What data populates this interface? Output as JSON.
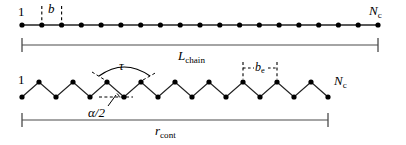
{
  "figure": {
    "background": "#ffffff",
    "ink": "#000000",
    "rule_color": "#4a4a4a"
  },
  "top_chain": {
    "name": "straight-chain",
    "start_label": "1",
    "end_label_symbol": "N",
    "end_label_sub": "c",
    "bead_count": 19,
    "bead_spacing_px": 19.8,
    "first_bead_x": 22,
    "last_bead_x": 378,
    "baseline_y": 25,
    "bond_label_symbol": "b",
    "bond_label_sub": "",
    "bond_marker_left_x": 42,
    "bond_marker_right_x": 62
  },
  "top_measure": {
    "name": "L-chain-measure",
    "symbol": "L",
    "sub": "chain",
    "left_x": 22,
    "right_x": 378,
    "y": 45
  },
  "bottom_chain": {
    "name": "zigzag-chain",
    "start_label": "1",
    "end_label_symbol": "N",
    "end_label_sub": "c",
    "vertex_count": 19,
    "first_vertex_x": 22,
    "last_vertex_x": 328,
    "top_y": 82,
    "bottom_y": 97,
    "torsion_symbol": "τ",
    "angle_symbol": "α/2",
    "effective_bond_symbol": "b",
    "effective_bond_sub": "e",
    "be_marker_left_x": 256,
    "be_marker_right_x": 290
  },
  "bottom_measure": {
    "name": "r-cont-measure",
    "symbol": "r",
    "sub": "cont",
    "left_x": 22,
    "right_x": 328,
    "y": 120
  }
}
